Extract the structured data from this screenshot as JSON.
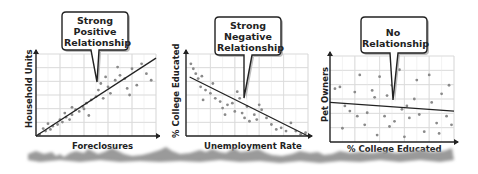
{
  "chart_data": [
    {
      "type": "scatter",
      "title": "Strong Positive Relationship",
      "xlabel": "Foreclosures",
      "ylabel": "Household Units",
      "grid": true,
      "trend": "positive",
      "trend_line": {
        "x": [
          0,
          10
        ],
        "y": [
          0,
          9.5
        ]
      },
      "points": [
        [
          0.3,
          0.2
        ],
        [
          0.8,
          0.6
        ],
        [
          0.6,
          0.9
        ],
        [
          1.2,
          0.8
        ],
        [
          1.4,
          1.2
        ],
        [
          1.0,
          1.5
        ],
        [
          1.8,
          1.4
        ],
        [
          2.0,
          2.0
        ],
        [
          2.2,
          1.7
        ],
        [
          2.5,
          2.3
        ],
        [
          2.8,
          2.0
        ],
        [
          2.4,
          2.8
        ],
        [
          3.0,
          2.6
        ],
        [
          3.3,
          3.2
        ],
        [
          3.0,
          3.5
        ],
        [
          3.6,
          3.0
        ],
        [
          3.9,
          3.6
        ],
        [
          4.2,
          4.0
        ],
        [
          4.0,
          3.3
        ],
        [
          4.6,
          4.4
        ],
        [
          4.4,
          2.5
        ],
        [
          5.0,
          4.8
        ],
        [
          5.2,
          5.6
        ],
        [
          5.6,
          4.6
        ],
        [
          5.4,
          6.4
        ],
        [
          6.0,
          6.0
        ],
        [
          6.2,
          5.2
        ],
        [
          6.6,
          6.8
        ],
        [
          7.0,
          7.4
        ],
        [
          7.4,
          7.0
        ],
        [
          7.6,
          5.8
        ],
        [
          8.0,
          8.2
        ],
        [
          8.4,
          6.2
        ],
        [
          8.8,
          8.8
        ],
        [
          9.2,
          7.6
        ],
        [
          9.6,
          6.8
        ],
        [
          7.8,
          5.0
        ],
        [
          6.8,
          8.4
        ],
        [
          5.8,
          7.2
        ]
      ]
    },
    {
      "type": "scatter",
      "title": "Strong Negative Relationship",
      "xlabel": "Unemployment Rate",
      "ylabel": "% College Educated",
      "grid": true,
      "trend": "negative",
      "trend_line": {
        "x": [
          0.3,
          10
        ],
        "y": [
          7.2,
          0
        ]
      },
      "points": [
        [
          0.4,
          8.8
        ],
        [
          0.6,
          8.2
        ],
        [
          0.8,
          7.6
        ],
        [
          1.0,
          7.0
        ],
        [
          1.3,
          7.3
        ],
        [
          1.2,
          6.0
        ],
        [
          1.6,
          5.6
        ],
        [
          1.4,
          4.4
        ],
        [
          2.0,
          5.2
        ],
        [
          2.2,
          6.4
        ],
        [
          2.4,
          4.6
        ],
        [
          2.8,
          4.2
        ],
        [
          3.0,
          3.4
        ],
        [
          3.2,
          2.6
        ],
        [
          3.4,
          3.8
        ],
        [
          3.8,
          4.0
        ],
        [
          4.0,
          3.0
        ],
        [
          4.2,
          5.4
        ],
        [
          4.4,
          4.6
        ],
        [
          4.6,
          2.8
        ],
        [
          4.8,
          2.2
        ],
        [
          5.0,
          3.6
        ],
        [
          5.2,
          1.8
        ],
        [
          5.6,
          2.6
        ],
        [
          5.8,
          2.0
        ],
        [
          6.2,
          3.2
        ],
        [
          6.6,
          2.2
        ],
        [
          7.0,
          1.4
        ],
        [
          7.4,
          0.8
        ],
        [
          7.8,
          1.0
        ],
        [
          8.2,
          0.6
        ],
        [
          8.6,
          1.6
        ],
        [
          9.0,
          0.6
        ],
        [
          9.4,
          0.2
        ],
        [
          9.8,
          0.4
        ],
        [
          6.0,
          3.8
        ]
      ]
    },
    {
      "type": "scatter",
      "title": "No Relationship",
      "xlabel": "% College Educated",
      "ylabel": "Pet Owners",
      "grid": true,
      "trend": "none",
      "trend_line": {
        "x": [
          0,
          10
        ],
        "y": [
          4.6,
          3.6
        ]
      },
      "points": [
        [
          0.4,
          6.2
        ],
        [
          0.8,
          6.4
        ],
        [
          1.2,
          4.2
        ],
        [
          1.6,
          3.6
        ],
        [
          2.0,
          5.8
        ],
        [
          2.4,
          7.8
        ],
        [
          2.8,
          2.0
        ],
        [
          3.0,
          3.4
        ],
        [
          3.4,
          6.0
        ],
        [
          3.6,
          5.2
        ],
        [
          4.0,
          7.6
        ],
        [
          4.4,
          3.0
        ],
        [
          4.6,
          5.4
        ],
        [
          5.0,
          6.6
        ],
        [
          5.2,
          2.4
        ],
        [
          5.6,
          8.4
        ],
        [
          5.8,
          3.8
        ],
        [
          6.2,
          4.2
        ],
        [
          6.4,
          2.8
        ],
        [
          6.8,
          5.0
        ],
        [
          7.0,
          7.2
        ],
        [
          7.2,
          3.2
        ],
        [
          7.6,
          1.2
        ],
        [
          8.0,
          7.8
        ],
        [
          8.2,
          4.6
        ],
        [
          8.6,
          2.2
        ],
        [
          9.0,
          5.6
        ],
        [
          9.4,
          3.0
        ],
        [
          9.6,
          6.6
        ],
        [
          1.0,
          1.6
        ],
        [
          3.8,
          0.8
        ],
        [
          6.0,
          0.6
        ],
        [
          8.8,
          1.0
        ],
        [
          2.2,
          3.0
        ],
        [
          4.8,
          1.8
        ],
        [
          9.8,
          2.0
        ]
      ]
    }
  ],
  "panels": [
    {
      "callout": [
        "Strong",
        "Positive",
        "Relationship"
      ],
      "xlabel": "Foreclosures",
      "ylabel": "Household Units"
    },
    {
      "callout": [
        "Strong",
        "Negative",
        "Relationship"
      ],
      "xlabel": "Unemployment Rate",
      "ylabel": "% College Educated"
    },
    {
      "callout": [
        "No",
        "Relationship"
      ],
      "xlabel": "% College Educated",
      "ylabel": "Pet Owners"
    }
  ]
}
